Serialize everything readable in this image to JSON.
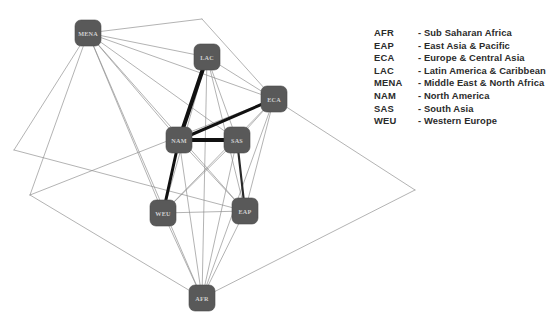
{
  "diagram": {
    "type": "node-link-graph",
    "background_color": "#ffffff",
    "node_fill_color": "#595959",
    "node_text_color": "#cfcfcf",
    "edge_color": "#8a8a8a",
    "strong_edge_color": "#111111",
    "nodes": [
      {
        "id": "MENA",
        "label": "MENA",
        "x": 88,
        "y": 33
      },
      {
        "id": "LAC",
        "label": "LAC",
        "x": 207,
        "y": 57
      },
      {
        "id": "ECA",
        "label": "ECA",
        "x": 274,
        "y": 99
      },
      {
        "id": "NAM",
        "label": "NAM",
        "x": 179,
        "y": 140
      },
      {
        "id": "SAS",
        "label": "SAS",
        "x": 237,
        "y": 140
      },
      {
        "id": "WEU",
        "label": "WEU",
        "x": 163,
        "y": 213
      },
      {
        "id": "EAP",
        "label": "EAP",
        "x": 245,
        "y": 211
      },
      {
        "id": "AFR",
        "label": "AFR",
        "x": 202,
        "y": 298
      }
    ],
    "outer_vertices": [
      {
        "id": "V-top",
        "x": 202,
        "y": 19
      },
      {
        "id": "V-right",
        "x": 415,
        "y": 190
      },
      {
        "id": "V-left",
        "x": 30,
        "y": 195
      },
      {
        "id": "V-upper-left",
        "x": 14,
        "y": 150
      }
    ],
    "edges": [
      {
        "from": "LAC",
        "to": "NAM",
        "weight": 5
      },
      {
        "from": "NAM",
        "to": "SAS",
        "weight": 5
      },
      {
        "from": "NAM",
        "to": "ECA",
        "weight": 4
      },
      {
        "from": "NAM",
        "to": "WEU",
        "weight": 4
      },
      {
        "from": "SAS",
        "to": "EAP",
        "weight": 3
      },
      {
        "from": "MENA",
        "to": "LAC",
        "weight": 1
      },
      {
        "from": "MENA",
        "to": "ECA",
        "weight": 1
      },
      {
        "from": "MENA",
        "to": "NAM",
        "weight": 1
      },
      {
        "from": "MENA",
        "to": "SAS",
        "weight": 1
      },
      {
        "from": "MENA",
        "to": "WEU",
        "weight": 1
      },
      {
        "from": "MENA",
        "to": "EAP",
        "weight": 1
      },
      {
        "from": "MENA",
        "to": "AFR",
        "weight": 1
      },
      {
        "from": "LAC",
        "to": "ECA",
        "weight": 1
      },
      {
        "from": "LAC",
        "to": "SAS",
        "weight": 1
      },
      {
        "from": "LAC",
        "to": "WEU",
        "weight": 1
      },
      {
        "from": "LAC",
        "to": "EAP",
        "weight": 1
      },
      {
        "from": "LAC",
        "to": "AFR",
        "weight": 1
      },
      {
        "from": "ECA",
        "to": "SAS",
        "weight": 1
      },
      {
        "from": "ECA",
        "to": "WEU",
        "weight": 1
      },
      {
        "from": "ECA",
        "to": "EAP",
        "weight": 1
      },
      {
        "from": "ECA",
        "to": "AFR",
        "weight": 1
      },
      {
        "from": "NAM",
        "to": "EAP",
        "weight": 1
      },
      {
        "from": "NAM",
        "to": "AFR",
        "weight": 1
      },
      {
        "from": "SAS",
        "to": "WEU",
        "weight": 1
      },
      {
        "from": "SAS",
        "to": "AFR",
        "weight": 1
      },
      {
        "from": "WEU",
        "to": "EAP",
        "weight": 1
      },
      {
        "from": "WEU",
        "to": "AFR",
        "weight": 1
      },
      {
        "from": "EAP",
        "to": "AFR",
        "weight": 1
      }
    ],
    "outer_edges": [
      {
        "from": "MENA",
        "to": "V-top"
      },
      {
        "from": "V-top",
        "to": "ECA"
      },
      {
        "from": "ECA",
        "to": "V-right"
      },
      {
        "from": "V-right",
        "to": "AFR"
      },
      {
        "from": "AFR",
        "to": "V-left"
      },
      {
        "from": "V-left",
        "to": "MENA"
      },
      {
        "from": "V-left",
        "to": "ECA"
      },
      {
        "from": "V-upper-left",
        "to": "EAP"
      },
      {
        "from": "V-upper-left",
        "to": "MENA"
      }
    ]
  },
  "legend": {
    "rows": [
      {
        "abbr": "AFR",
        "dash": "-",
        "desc": "Sub Saharan Africa"
      },
      {
        "abbr": "EAP",
        "dash": "-",
        "desc": "East Asia & Pacific"
      },
      {
        "abbr": "ECA",
        "dash": "-",
        "desc": "Europe & Central Asia"
      },
      {
        "abbr": "LAC",
        "dash": "-",
        "desc": "Latin America & Caribbean"
      },
      {
        "abbr": "MENA",
        "dash": "-",
        "desc": "Middle East & North Africa"
      },
      {
        "abbr": "NAM",
        "dash": "-",
        "desc": "North America"
      },
      {
        "abbr": "SAS",
        "dash": "-",
        "desc": "South Asia"
      },
      {
        "abbr": "WEU",
        "dash": "-",
        "desc": "Western Europe"
      }
    ]
  }
}
